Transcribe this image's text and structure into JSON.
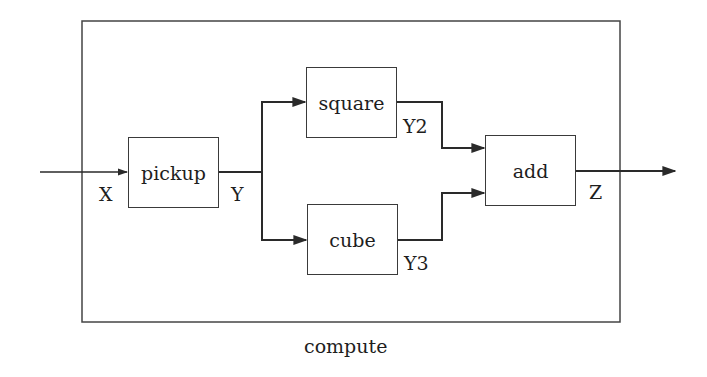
{
  "diagram": {
    "type": "block-diagram",
    "container": {
      "label": "compute"
    },
    "blocks": [
      {
        "id": "pickup",
        "label": "pickup"
      },
      {
        "id": "square",
        "label": "square"
      },
      {
        "id": "cube",
        "label": "cube"
      },
      {
        "id": "add",
        "label": "add"
      }
    ],
    "signals": [
      {
        "name": "X",
        "from": "input",
        "to": "pickup"
      },
      {
        "name": "Y",
        "from": "pickup",
        "to": [
          "square",
          "cube"
        ]
      },
      {
        "name": "Y2",
        "from": "square",
        "to": "add"
      },
      {
        "name": "Y3",
        "from": "cube",
        "to": "add"
      },
      {
        "name": "Z",
        "from": "add",
        "to": "output"
      }
    ],
    "colors": {
      "line": "#2a2a2a",
      "background": "#ffffff"
    }
  }
}
